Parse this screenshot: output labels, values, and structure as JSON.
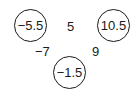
{
  "nodes": [
    {
      "id": "left",
      "value": "−5.5"
    },
    {
      "id": "right",
      "value": "10.5"
    },
    {
      "id": "bottom",
      "value": "−1.5"
    }
  ],
  "edges": [
    {
      "between": "left-right",
      "value": "5"
    },
    {
      "between": "left-bottom",
      "value": "−7"
    },
    {
      "between": "right-bottom",
      "value": "9"
    }
  ]
}
